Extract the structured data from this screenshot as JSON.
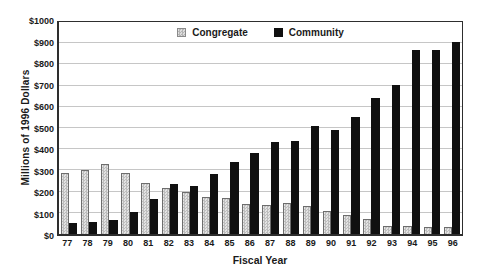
{
  "figure": {
    "background_color": "#ffffff",
    "frame_color": "#2e2e2e",
    "gridline_color": "#c6c6c6"
  },
  "chart_data": {
    "type": "bar",
    "title": "",
    "xlabel": "Fiscal Year",
    "ylabel": "Millions of 1996 Dollars",
    "categories": [
      "77",
      "78",
      "79",
      "80",
      "81",
      "82",
      "83",
      "84",
      "85",
      "86",
      "87",
      "88",
      "89",
      "90",
      "91",
      "92",
      "93",
      "94",
      "95",
      "96"
    ],
    "series": [
      {
        "name": "Congregate",
        "color": "#cccccc",
        "pattern": "checker",
        "values": [
          290,
          300,
          330,
          290,
          240,
          215,
          200,
          175,
          170,
          140,
          135,
          145,
          130,
          110,
          90,
          70,
          40,
          40,
          35,
          35
        ]
      },
      {
        "name": "Community",
        "color": "#101010",
        "pattern": "solid",
        "values": [
          50,
          55,
          65,
          105,
          165,
          235,
          225,
          285,
          340,
          380,
          435,
          440,
          510,
          490,
          550,
          640,
          705,
          870,
          870,
          905
        ]
      }
    ],
    "ylim": [
      0,
      1000
    ],
    "yticks": [
      0,
      100,
      200,
      300,
      400,
      500,
      600,
      700,
      800,
      900,
      1000
    ],
    "ytick_labels": [
      "$0",
      "$100",
      "$200",
      "$300",
      "$400",
      "$500",
      "$600",
      "$700",
      "$800",
      "$900",
      "$1000"
    ],
    "grid": "horizontal",
    "legend_position": "top-center-inside"
  }
}
